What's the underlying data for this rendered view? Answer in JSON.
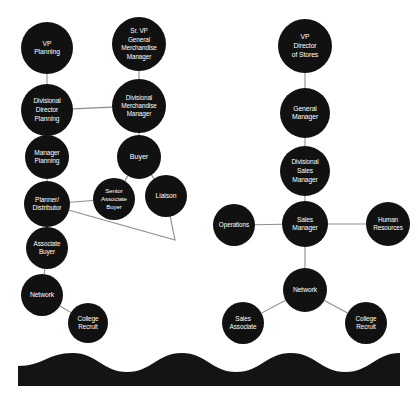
{
  "diagram": {
    "type": "org-chart",
    "background_color": "#ffffff",
    "node_color": "#111111",
    "node_text_color": "#ffffff",
    "edge_color": "#8c8c8c",
    "nodes": [
      {
        "id": "vp-planning",
        "label": "VP\nPlanning",
        "lines": [
          "VP",
          "Planning"
        ],
        "cx": 47,
        "cy": 48,
        "r": 26,
        "font_size": 6.8
      },
      {
        "id": "sr-vp-gmm",
        "label": "Sr. VP\nGeneral\nMerchandise\nManager",
        "lines": [
          "Sr. VP",
          "General",
          "Merchandise",
          "Manager"
        ],
        "cx": 139,
        "cy": 44,
        "r": 27,
        "font_size": 6.4
      },
      {
        "id": "vp-director-stores",
        "label": "VP\nDirector\nof Stores",
        "lines": [
          "VP",
          "Director",
          "of Stores"
        ],
        "cx": 305,
        "cy": 46,
        "r": 27,
        "font_size": 6.8
      },
      {
        "id": "divisional-director-planning",
        "label": "Divisional\nDirector\nPlanning",
        "lines": [
          "Divisional",
          "Director",
          "Planning"
        ],
        "cx": 47,
        "cy": 110,
        "r": 26,
        "font_size": 6.6
      },
      {
        "id": "divisional-merchandise-manager",
        "label": "Divisional\nMerchandise\nManager",
        "lines": [
          "Divisional",
          "Merchandise",
          "Manager"
        ],
        "cx": 139,
        "cy": 106,
        "r": 27,
        "font_size": 6.4
      },
      {
        "id": "general-manager",
        "label": "General\nManager",
        "lines": [
          "General",
          "Manager"
        ],
        "cx": 305,
        "cy": 113,
        "r": 25,
        "font_size": 6.8
      },
      {
        "id": "manager-planning",
        "label": "Manager\nPlanning",
        "lines": [
          "Manager",
          "Planning"
        ],
        "cx": 47,
        "cy": 157,
        "r": 22,
        "font_size": 6.6
      },
      {
        "id": "buyer",
        "label": "Buyer",
        "lines": [
          "Buyer"
        ],
        "cx": 139,
        "cy": 157,
        "r": 22,
        "font_size": 7.2
      },
      {
        "id": "divisional-sales-manager",
        "label": "Divisional\nSales\nManager",
        "lines": [
          "Divisional",
          "Sales",
          "Manager"
        ],
        "cx": 305,
        "cy": 171,
        "r": 25,
        "font_size": 6.6
      },
      {
        "id": "planner-distributor",
        "label": "Planner/\nDistributor",
        "lines": [
          "Planner/",
          "Distributor"
        ],
        "cx": 47,
        "cy": 204,
        "r": 23,
        "font_size": 6.6
      },
      {
        "id": "senior-associate-buyer",
        "label": "Senior\nAssociate\nBuyer",
        "lines": [
          "Senior",
          "Associate",
          "Buyer"
        ],
        "cx": 114,
        "cy": 199,
        "r": 21,
        "font_size": 6.2
      },
      {
        "id": "liaison",
        "label": "Liaison",
        "lines": [
          "Liaison"
        ],
        "cx": 166,
        "cy": 196,
        "r": 21,
        "font_size": 6.8
      },
      {
        "id": "operations",
        "label": "Operations",
        "lines": [
          "Operations"
        ],
        "cx": 234,
        "cy": 225,
        "r": 21,
        "font_size": 6.4
      },
      {
        "id": "sales-manager",
        "label": "Sales\nManager",
        "lines": [
          "Sales",
          "Manager"
        ],
        "cx": 305,
        "cy": 224,
        "r": 23,
        "font_size": 6.6
      },
      {
        "id": "human-resources",
        "label": "Human\nResources",
        "lines": [
          "Human",
          "Resources"
        ],
        "cx": 388,
        "cy": 224,
        "r": 22,
        "font_size": 6.4
      },
      {
        "id": "associate-buyer",
        "label": "Associate\nBuyer",
        "lines": [
          "Associate",
          "Buyer"
        ],
        "cx": 47,
        "cy": 248,
        "r": 21,
        "font_size": 6.4
      },
      {
        "id": "network-left",
        "label": "Network",
        "lines": [
          "Network"
        ],
        "cx": 42,
        "cy": 295,
        "r": 21,
        "font_size": 6.8
      },
      {
        "id": "network-right",
        "label": "Network",
        "lines": [
          "Network"
        ],
        "cx": 305,
        "cy": 290,
        "r": 22,
        "font_size": 6.8
      },
      {
        "id": "college-recruit-left",
        "label": "College\nRecruit",
        "lines": [
          "College",
          "Recruit"
        ],
        "cx": 88,
        "cy": 323,
        "r": 20,
        "font_size": 6.4
      },
      {
        "id": "sales-associate",
        "label": "Sales\nAssociate",
        "lines": [
          "Sales",
          "Associate"
        ],
        "cx": 243,
        "cy": 323,
        "r": 21,
        "font_size": 6.4
      },
      {
        "id": "college-recruit-right",
        "label": "College\nRecruit",
        "lines": [
          "College",
          "Recruit"
        ],
        "cx": 366,
        "cy": 323,
        "r": 21,
        "font_size": 6.4
      }
    ],
    "edges": [
      {
        "from": "vp-planning",
        "to": "divisional-director-planning",
        "kind": "vertical"
      },
      {
        "from": "sr-vp-gmm",
        "to": "divisional-merchandise-manager",
        "kind": "vertical"
      },
      {
        "from": "divisional-director-planning",
        "to": "divisional-merchandise-manager",
        "kind": "horizontal"
      },
      {
        "from": "divisional-director-planning",
        "to": "manager-planning",
        "kind": "vertical"
      },
      {
        "from": "divisional-merchandise-manager",
        "to": "buyer",
        "kind": "vertical"
      },
      {
        "from": "manager-planning",
        "to": "planner-distributor",
        "kind": "vertical"
      },
      {
        "from": "buyer",
        "to": "senior-associate-buyer",
        "kind": "diagonal"
      },
      {
        "from": "buyer",
        "to": "liaison",
        "kind": "diagonal"
      },
      {
        "from": "planner-distributor",
        "to": "senior-associate-buyer",
        "kind": "horizontal"
      },
      {
        "from": "planner-distributor",
        "to": "liaison",
        "kind": "v-elbow"
      },
      {
        "from": "planner-distributor",
        "to": "associate-buyer",
        "kind": "vertical"
      },
      {
        "from": "associate-buyer",
        "to": "network-left",
        "kind": "vertical"
      },
      {
        "from": "network-left",
        "to": "college-recruit-left",
        "kind": "diagonal"
      },
      {
        "from": "vp-director-stores",
        "to": "general-manager",
        "kind": "vertical"
      },
      {
        "from": "general-manager",
        "to": "divisional-sales-manager",
        "kind": "vertical"
      },
      {
        "from": "divisional-sales-manager",
        "to": "sales-manager",
        "kind": "vertical"
      },
      {
        "from": "operations",
        "to": "sales-manager",
        "kind": "horizontal"
      },
      {
        "from": "sales-manager",
        "to": "human-resources",
        "kind": "horizontal"
      },
      {
        "from": "sales-manager",
        "to": "network-right",
        "kind": "vertical"
      },
      {
        "from": "network-right",
        "to": "sales-associate",
        "kind": "diagonal"
      },
      {
        "from": "network-right",
        "to": "college-recruit-right",
        "kind": "diagonal"
      }
    ],
    "decoration": {
      "name": "wave-band",
      "fill": "#141414",
      "left": 18,
      "right": 400,
      "bottom": 386,
      "crest_y": 353,
      "trough_y": 372
    }
  }
}
